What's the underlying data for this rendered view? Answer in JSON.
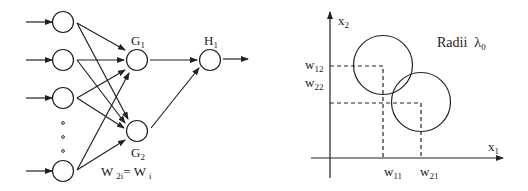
{
  "network": {
    "input_count_visible": 4,
    "ellipsis": "o o o",
    "hidden_nodes": [
      {
        "label": "G",
        "subscript": "1"
      },
      {
        "label": "G",
        "subscript": "2"
      }
    ],
    "output_node": {
      "label": "H",
      "subscript": "1"
    },
    "weight_eq": {
      "lhs": "W",
      "lhs_sub": "2i",
      "eq": "= ",
      "rhs": "W",
      "rhs_sub": "i"
    }
  },
  "plot": {
    "x_axis": {
      "label": "x",
      "subscript": "1"
    },
    "y_axis": {
      "label": "x",
      "subscript": "2"
    },
    "annotation": {
      "text": "Radii",
      "symbol": "λ",
      "subscript": "0"
    },
    "ticks": {
      "w11": {
        "label": "w",
        "subscript": "11"
      },
      "w21": {
        "label": "w",
        "subscript": "21"
      },
      "w12": {
        "label": "w",
        "subscript": "12"
      },
      "w22": {
        "label": "w",
        "subscript": "22"
      }
    },
    "circles": [
      {
        "name": "circle-1",
        "center": [
          "w11",
          "w12"
        ]
      },
      {
        "name": "circle-2",
        "center": [
          "w21",
          "w22"
        ]
      }
    ]
  }
}
